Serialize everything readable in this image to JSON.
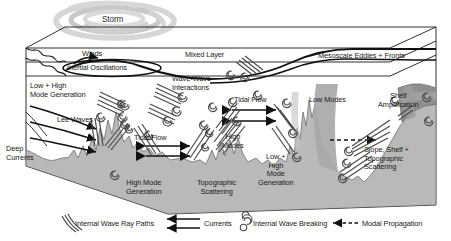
{
  "figure": {
    "colors": {
      "seafloor": "#b9b9b9",
      "seafloor_edge": "#6e6e6e",
      "shelf_dark": "#8f8f8f",
      "low_modes_beam": "#a8a8a8",
      "storm": "#cfcfcf",
      "line": "#1a1a1a",
      "background": "#ffffff"
    }
  },
  "labels": {
    "storm": "Storm",
    "winds": "Winds",
    "inertial_oscillations": "Inertial Oscillations",
    "mixed_layer": "Mixed Layer",
    "mesoscale_eddies_fronts": "Mesoscale Eddies + Fronts",
    "low_high_mode_generation_top": "Low + High\nMode Generation",
    "wave_wave_interactions": "Wave-Wave\nInteractions",
    "tidal_flow_upper": "Tidal Flow",
    "low_modes": "Low Modes",
    "shelf_amplification": "Shelf\nAmplification",
    "lee_waves": "Lee Waves",
    "deep_currents": "Deep\nCurrents",
    "tidal_flow_left": "Tidal Flow",
    "high_modes": "High\nModes",
    "high_mode_generation": "High Mode\nGeneration",
    "topographic_scattering": "Topographic\nScattering",
    "low_high_mode_generation_mid": "Low +\nHigh\nMode\nGeneration",
    "slope_shelf_topographic_scattering": "Slope, Shelf +\nTopographic\nScattering"
  },
  "legend": {
    "items": [
      {
        "id": "internal-wave-ray-paths",
        "label": "Internal Wave Ray Paths",
        "symbol": "ray-lines-icon"
      },
      {
        "id": "currents",
        "label": "Currents",
        "symbol": "double-arrow-left-icon"
      },
      {
        "id": "internal-wave-breaking",
        "label": "Internal Wave Breaking",
        "symbol": "spiral-curl-icon"
      },
      {
        "id": "modal-propagation",
        "label": "Modal Propagation",
        "symbol": "dashed-arrow-left-icon"
      }
    ]
  }
}
